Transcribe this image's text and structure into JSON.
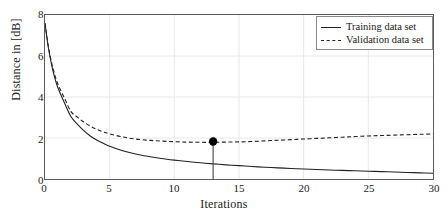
{
  "chart_data": {
    "type": "line",
    "title": "",
    "xlabel": "Iterations",
    "ylabel": "Distance in [dB]",
    "xlim": [
      0,
      30
    ],
    "ylim": [
      0,
      8
    ],
    "xticks": [
      0,
      5,
      10,
      15,
      20,
      25,
      30
    ],
    "yticks": [
      0,
      2,
      4,
      6,
      8
    ],
    "grid": true,
    "legend_position": "top-right",
    "series": [
      {
        "name": "Training data set",
        "style": "solid",
        "color": "#222222",
        "x": [
          0,
          0.25,
          0.5,
          0.75,
          1,
          1.5,
          2,
          2.5,
          3,
          3.5,
          4,
          4.5,
          5,
          6,
          7,
          8,
          9,
          10,
          11,
          12,
          13,
          14,
          15,
          16,
          17,
          18,
          19,
          20,
          21,
          22,
          23,
          24,
          25,
          26,
          27,
          28,
          29,
          30
        ],
        "y": [
          7.6,
          6.45,
          5.6,
          4.95,
          4.45,
          3.72,
          3.05,
          2.68,
          2.36,
          2.1,
          1.9,
          1.74,
          1.6,
          1.38,
          1.22,
          1.1,
          1.0,
          0.92,
          0.85,
          0.79,
          0.74,
          0.69,
          0.65,
          0.61,
          0.575,
          0.545,
          0.515,
          0.49,
          0.465,
          0.44,
          0.42,
          0.4,
          0.38,
          0.36,
          0.34,
          0.32,
          0.3,
          0.28
        ]
      },
      {
        "name": "Validation data set",
        "style": "dashed",
        "color": "#222222",
        "x": [
          0,
          0.25,
          0.5,
          0.75,
          1,
          1.5,
          2,
          2.5,
          3,
          3.5,
          4,
          4.5,
          5,
          6,
          7,
          8,
          9,
          10,
          11,
          12,
          13,
          14,
          15,
          16,
          17,
          18,
          19,
          20,
          21,
          22,
          23,
          24,
          25,
          26,
          27,
          28,
          29,
          30
        ],
        "y": [
          7.6,
          6.5,
          5.7,
          5.1,
          4.62,
          3.95,
          3.3,
          3.02,
          2.78,
          2.58,
          2.42,
          2.3,
          2.2,
          2.05,
          1.95,
          1.89,
          1.85,
          1.82,
          1.8,
          1.79,
          1.79,
          1.8,
          1.81,
          1.83,
          1.86,
          1.89,
          1.92,
          1.95,
          1.98,
          2.01,
          2.04,
          2.07,
          2.1,
          2.12,
          2.14,
          2.16,
          2.18,
          2.2
        ]
      }
    ],
    "marker": {
      "label": "best validation point",
      "x": 13,
      "y": 1.83,
      "color": "#000000",
      "stem": true
    },
    "legend": [
      {
        "label": "Training data set",
        "style": "solid"
      },
      {
        "label": "Validation data set",
        "style": "dashed"
      }
    ]
  }
}
